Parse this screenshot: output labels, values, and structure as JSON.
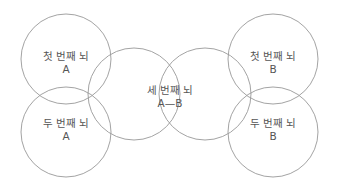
{
  "diagram": {
    "stroke_color": "#999999",
    "text_color": "#555555",
    "circles": [
      {
        "id": "first-brain-a",
        "cx": 66,
        "cy": 59,
        "r": 45,
        "title": "첫 번째 뇌",
        "sub": "A"
      },
      {
        "id": "second-brain-a",
        "cx": 66,
        "cy": 132,
        "r": 45,
        "title": "두 번째 뇌",
        "sub": "A"
      },
      {
        "id": "third-brain-left",
        "cx": 134,
        "cy": 94,
        "r": 46,
        "title": "",
        "sub": ""
      },
      {
        "id": "third-brain-right",
        "cx": 205,
        "cy": 94,
        "r": 46,
        "title": "",
        "sub": ""
      },
      {
        "id": "first-brain-b",
        "cx": 273,
        "cy": 59,
        "r": 45,
        "title": "첫 번째 뇌",
        "sub": "B"
      },
      {
        "id": "second-brain-b",
        "cx": 273,
        "cy": 132,
        "r": 45,
        "title": "두 번째 뇌",
        "sub": "B"
      }
    ],
    "labels": {
      "first_a": {
        "title": "첫 번째 뇌",
        "sub": "A"
      },
      "second_a": {
        "title": "두 번째 뇌",
        "sub": "A"
      },
      "third": {
        "title": "세 번째 뇌",
        "sub": "A—B"
      },
      "first_b": {
        "title": "첫 번째 뇌",
        "sub": "B"
      },
      "second_b": {
        "title": "두 번째 뇌",
        "sub": "B"
      }
    }
  }
}
